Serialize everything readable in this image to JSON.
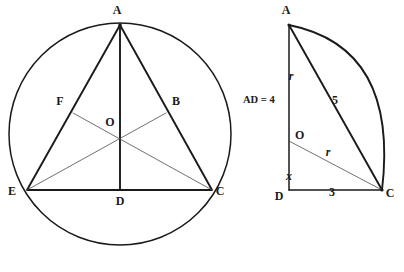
{
  "figure": {
    "background_color": "#ffffff",
    "ink_color": "#1a1a1a",
    "thin_ink_color": "#4d4d4d"
  },
  "left_figure": {
    "name": "inscribed-equilateral-triangle",
    "circle": {
      "cx": 120,
      "cy": 134,
      "r": 111
    },
    "vertices": {
      "A": {
        "x": 120,
        "y": 25,
        "label": "A",
        "label_x": 117,
        "label_y": 14
      },
      "E": {
        "x": 27,
        "y": 190,
        "label": "E",
        "label_x": 12,
        "label_y": 195
      },
      "C": {
        "x": 212,
        "y": 190,
        "label": "C",
        "label_x": 218,
        "label_y": 195
      },
      "O": {
        "x": 120,
        "y": 136,
        "label": "O",
        "label_x": 109,
        "label_y": 124
      },
      "D": {
        "x": 120,
        "y": 190,
        "label": "D",
        "label_x": 115,
        "label_y": 204
      },
      "F": {
        "x": 73,
        "y": 113,
        "label": "F",
        "label_x": 58,
        "label_y": 104
      },
      "B": {
        "x": 166,
        "y": 113,
        "label": "B",
        "label_x": 171,
        "label_y": 104
      }
    }
  },
  "right_figure": {
    "name": "right-triangle-with-radius",
    "vertices": {
      "A": {
        "x": 289,
        "y": 25,
        "label": "A",
        "label_x": 285,
        "label_y": 14
      },
      "D": {
        "x": 289,
        "y": 190,
        "label": "D",
        "label_x": 276,
        "label_y": 198
      },
      "C": {
        "x": 382,
        "y": 190,
        "label": "C",
        "label_x": 388,
        "label_y": 196
      },
      "O": {
        "x": 289,
        "y": 141,
        "label": "O",
        "label_x": 292,
        "label_y": 138
      }
    },
    "arc": {
      "start_x": 289,
      "start_y": 25,
      "end_x": 382,
      "end_y": 190,
      "bulge_x": 396
    },
    "measures": {
      "ad_label": "AD = 4",
      "ad_label_x": 243,
      "ad_label_y": 100,
      "r_upper": "r",
      "r_upper_x": 290,
      "r_upper_y": 77,
      "hypotenuse": "5",
      "hypotenuse_x": 333,
      "hypotenuse_y": 101,
      "x_segment": "x",
      "x_segment_x": 288,
      "x_segment_y": 177,
      "r_lower": "r",
      "r_lower_x": 326,
      "r_lower_y": 153,
      "base": "3",
      "base_x": 331,
      "base_y": 196
    }
  }
}
